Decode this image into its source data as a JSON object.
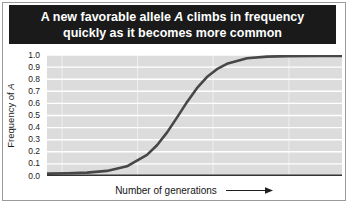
{
  "figure": {
    "title": {
      "line1_pre": "A new favorable allele ",
      "line1_italic": "A",
      "line1_post": " climbs in frequency",
      "line2": "quickly as it becomes more common"
    },
    "colors": {
      "banner_bg": "#1a1a1a",
      "banner_text": "#ffffff",
      "plot_bg": "#dcdcdc",
      "gridline": "#ffffff",
      "curve": "#474747",
      "axis_line": "#333333",
      "frame_border": "#9a9a9a"
    }
  },
  "chart_data": {
    "type": "line",
    "title": "A new favorable allele A climbs in frequency quickly as it becomes more common",
    "xlabel": "Number of generations",
    "xlabel_arrow": "right-arrow",
    "ylabel_pre": "Frequency of ",
    "ylabel_italic": "A",
    "ylim": [
      0.0,
      1.0
    ],
    "ytick_step": 0.1,
    "yticks": [
      "1.0",
      "0.9",
      "0.8",
      "0.7",
      "0.6",
      "0.5",
      "0.4",
      "0.3",
      "0.2",
      "0.1",
      "0.0"
    ],
    "x_tick_labels_visible": false,
    "grid": {
      "horizontal": "white line every 0.1",
      "vertical": "4 faint white lines, evenly spaced"
    },
    "vertical_grid_fractions": [
      0.051,
      0.307,
      0.563,
      0.82
    ],
    "series": [
      {
        "name": "Frequency of allele A",
        "shape": "logistic S-curve",
        "x_relative": [
          0,
          0.068,
          0.136,
          0.203,
          0.271,
          0.339,
          0.373,
          0.407,
          0.441,
          0.475,
          0.508,
          0.542,
          0.576,
          0.61,
          0.678,
          0.746,
          0.814,
          0.915,
          1.0
        ],
        "y": [
          0.02,
          0.023,
          0.028,
          0.042,
          0.08,
          0.174,
          0.254,
          0.36,
          0.484,
          0.612,
          0.726,
          0.817,
          0.883,
          0.927,
          0.973,
          0.987,
          0.991,
          0.992,
          0.993
        ]
      }
    ]
  }
}
